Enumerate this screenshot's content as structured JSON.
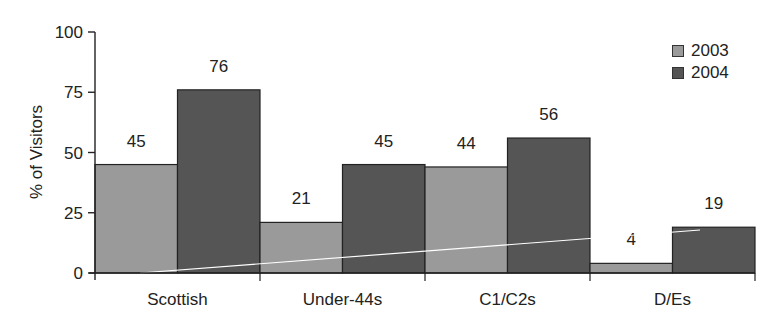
{
  "chart_data": {
    "type": "bar",
    "title": "",
    "xlabel": "",
    "ylabel": "% of Visitors",
    "ylim": [
      0,
      100
    ],
    "yticks": [
      0,
      25,
      50,
      75,
      100
    ],
    "grid": false,
    "legend_position": "top-right",
    "categories": [
      "Scottish",
      "Under-44s",
      "C1/C2s",
      "D/Es"
    ],
    "series": [
      {
        "name": "2003",
        "values": [
          45,
          21,
          44,
          4
        ],
        "color": "#9a9a9a"
      },
      {
        "name": "2004",
        "values": [
          76,
          45,
          56,
          19
        ],
        "color": "#555555"
      }
    ],
    "data_labels": true
  },
  "legend": {
    "items": [
      {
        "label": "2003",
        "color": "#9a9a9a"
      },
      {
        "label": "2004",
        "color": "#555555"
      }
    ]
  }
}
